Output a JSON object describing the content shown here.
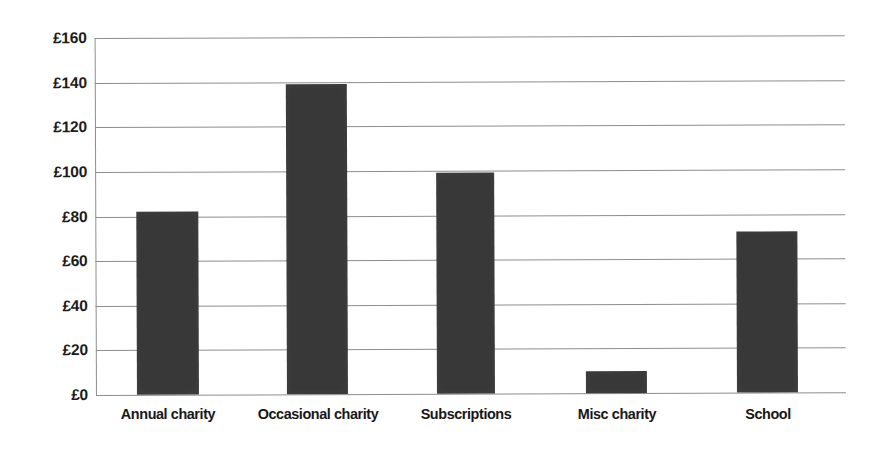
{
  "chart_data": {
    "type": "bar",
    "title": "",
    "subtitle": "",
    "xlabel": "",
    "ylabel": "",
    "categories": [
      "Annual charity",
      "Occasional charity",
      "Subscriptions",
      "Misc charity",
      "School"
    ],
    "values": [
      82,
      139,
      99,
      10,
      72
    ],
    "series": [
      {
        "name": "Amount",
        "values": [
          82,
          139,
          99,
          10,
          72
        ]
      }
    ],
    "ylim": [
      0,
      160
    ],
    "ytick_step": 20,
    "ytick_labels": [
      "£0",
      "£20",
      "£40",
      "£60",
      "£80",
      "£100",
      "£120",
      "£140",
      "£160"
    ],
    "ytick_values": [
      0,
      20,
      40,
      60,
      80,
      100,
      120,
      140,
      160
    ],
    "currency_symbol": "£",
    "grid": true,
    "grid_axis": "y",
    "legend": false,
    "legend_position": "none",
    "bar_color": "#383838",
    "gridline_color": "#8e8e8e",
    "axis_color": "#8e8e8e",
    "background_color": "#ffffff",
    "text_color": "#1c1c1c"
  }
}
